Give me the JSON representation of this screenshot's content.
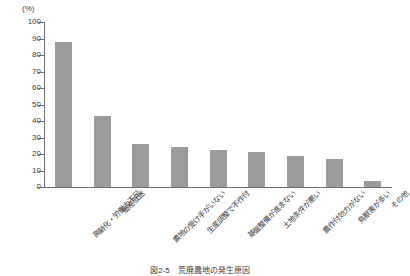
{
  "chart_data": {
    "type": "bar",
    "title": "",
    "unit_label": "(%)",
    "xlabel": "",
    "ylabel": "",
    "ylim": [
      0,
      100
    ],
    "ytick_step": 10,
    "yticks": [
      0,
      10,
      20,
      30,
      40,
      50,
      60,
      70,
      80,
      90,
      100
    ],
    "grid": false,
    "legend": false,
    "bar_color": "#9c9c9c",
    "axis_color": "#6e6e6e",
    "categories": [
      "高齢化・労働力不足",
      "価格低迷",
      "農地の受け手がいない",
      "生産調整で不作付",
      "基盤整備が進まない",
      "土地条件が悪い",
      "農作付効力がない",
      "鳥獣害が多い",
      "その他"
    ],
    "values": [
      88,
      43,
      26,
      24,
      22.5,
      21.5,
      18.5,
      17,
      3.5
    ]
  },
  "caption": {
    "text": "図2-5　荒廃農地の発生原因"
  }
}
